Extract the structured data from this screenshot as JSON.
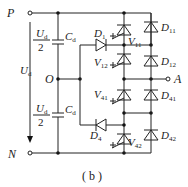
{
  "diagram": {
    "type": "three-level NPC inverter leg (circuit schematic)",
    "caption": "( b )",
    "terminals": {
      "P": "P",
      "N": "N",
      "O": "O",
      "A": "A"
    },
    "voltages": {
      "total": {
        "symbol": "U",
        "sub": "d"
      },
      "half_top": {
        "num_symbol": "U",
        "num_sub": "d",
        "den": "2"
      },
      "half_bottom": {
        "num_symbol": "U",
        "num_sub": "d",
        "den": "2"
      }
    },
    "capacitors": [
      {
        "symbol": "C",
        "sub": "d"
      },
      {
        "symbol": "C",
        "sub": "d"
      }
    ],
    "clamp_diodes": [
      {
        "symbol": "D",
        "sub": "1"
      },
      {
        "symbol": "D",
        "sub": "4"
      }
    ],
    "switches": [
      {
        "symbol": "V",
        "sub": "11"
      },
      {
        "symbol": "V",
        "sub": "12"
      },
      {
        "symbol": "V",
        "sub": "41"
      },
      {
        "symbol": "V",
        "sub": "42"
      }
    ],
    "antiparallel_diodes": [
      {
        "symbol": "D",
        "sub": "11"
      },
      {
        "symbol": "D",
        "sub": "12"
      },
      {
        "symbol": "D",
        "sub": "41"
      },
      {
        "symbol": "D",
        "sub": "42"
      }
    ]
  }
}
